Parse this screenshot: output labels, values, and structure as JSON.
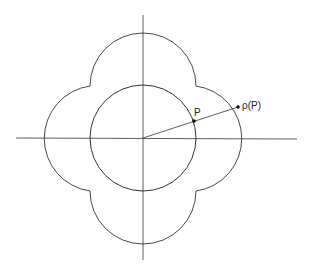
{
  "diagram": {
    "labels": {
      "p": "P",
      "rho_p": "ρ(P)"
    },
    "colors": {
      "stroke": "#333333",
      "background": "#ffffff"
    }
  }
}
